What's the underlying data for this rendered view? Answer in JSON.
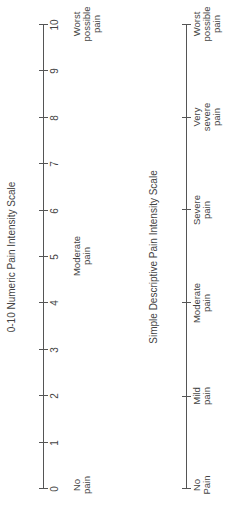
{
  "numeric_scale": {
    "title": "0-10 Numeric Pain Intensity Scale",
    "ticks": [
      "0",
      "1",
      "2",
      "3",
      "4",
      "5",
      "6",
      "7",
      "8",
      "9",
      "10"
    ],
    "anchors": [
      {
        "at": 0,
        "line1": "No",
        "line2": "pain",
        "line3": ""
      },
      {
        "at": 5,
        "line1": "Moderate",
        "line2": "pain",
        "line3": ""
      },
      {
        "at": 10,
        "line1": "Worst",
        "line2": "possible",
        "line3": "pain"
      }
    ]
  },
  "descriptive_scale": {
    "title": "Simple Descriptive Pain Intensity Scale",
    "labels": [
      {
        "line1": "No",
        "line2": "Pain",
        "line3": ""
      },
      {
        "line1": "Mild",
        "line2": "pain",
        "line3": ""
      },
      {
        "line1": "Moderate",
        "line2": "pain",
        "line3": ""
      },
      {
        "line1": "Severe",
        "line2": "pain",
        "line3": ""
      },
      {
        "line1": "Very",
        "line2": "severe",
        "line3": "pain"
      },
      {
        "line1": "Worst",
        "line2": "possible",
        "line3": "pain"
      }
    ]
  },
  "colors": {
    "line": "#555555",
    "text": "#444444"
  }
}
